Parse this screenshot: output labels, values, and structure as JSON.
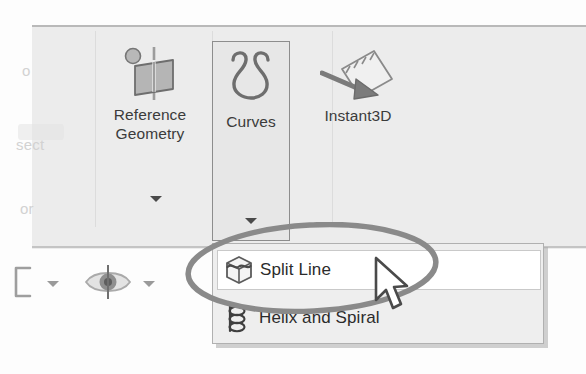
{
  "app": {
    "context": "SolidWorks Features ribbon tab with Curves flyout menu open"
  },
  "ribbon": {
    "buttons": [
      {
        "id": "reference-geometry",
        "label": "Reference\nGeometry",
        "icon": "reference-plane-icon",
        "has_dropdown": true,
        "state": "normal"
      },
      {
        "id": "curves",
        "label": "Curves",
        "icon": "curve-squiggle-icon",
        "has_dropdown": true,
        "state": "selected"
      },
      {
        "id": "instant3d",
        "label": "Instant3D",
        "icon": "ruler-arrow-icon",
        "has_dropdown": false,
        "state": "normal"
      }
    ],
    "ghost_labels": [
      {
        "text": "o",
        "x": 22,
        "y": 62
      },
      {
        "text": "sect",
        "x": 16,
        "y": 136
      },
      {
        "text": "or",
        "x": 20,
        "y": 200
      }
    ]
  },
  "view_strip": {
    "items": [
      {
        "id": "section-view",
        "icon": "bracket-icon",
        "has_dropdown": true
      },
      {
        "id": "hide-show",
        "icon": "eye-icon",
        "has_dropdown": true
      }
    ]
  },
  "curves_menu": {
    "items": [
      {
        "id": "split-line",
        "label": "Split Line",
        "icon": "split-cube-icon",
        "highlighted": true
      },
      {
        "id": "helix-and-spiral",
        "label": "Helix and Spiral",
        "icon": "helix-coil-icon",
        "highlighted": false
      }
    ]
  },
  "annotation": {
    "shape": "ellipse",
    "target": "Split Line",
    "color": "#8a8a8a"
  },
  "cursor": {
    "type": "arrow-pointer",
    "x": 372,
    "y": 256
  },
  "colors": {
    "ribbon_background": "#ececec",
    "menu_background": "#eeeeee",
    "highlight_background": "#ffffff",
    "text": "#2b2b2b",
    "icon_stroke": "#6e6e6e",
    "annotation": "#8a8a8a"
  }
}
